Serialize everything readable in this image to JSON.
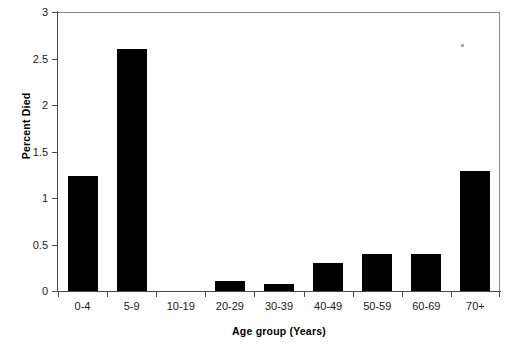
{
  "chart_data": {
    "type": "bar",
    "title": "",
    "subtitle": "",
    "xlabel": "Age group (Years)",
    "ylabel": "Percent Died",
    "categories": [
      "0-4",
      "5-9",
      "10-19",
      "20-29",
      "30-39",
      "40-49",
      "50-59",
      "60-69",
      "70+"
    ],
    "values": [
      1.24,
      2.6,
      0,
      0.11,
      0.08,
      0.3,
      0.4,
      0.4,
      1.29
    ],
    "ylim": [
      0,
      3
    ],
    "ytick_labels": [
      "3",
      "2.5",
      "2",
      "1.5",
      "1",
      "0.5",
      "0"
    ],
    "ytick_values": [
      3,
      2.5,
      2,
      1.5,
      1,
      0.5,
      0
    ],
    "grid": false,
    "legend": null,
    "legend_position": "none",
    "bar_color": "#000000",
    "axis_color": "#4a4a4a",
    "frame_color": "#8c8c8c",
    "background": "#ffffff",
    "annotations": []
  }
}
